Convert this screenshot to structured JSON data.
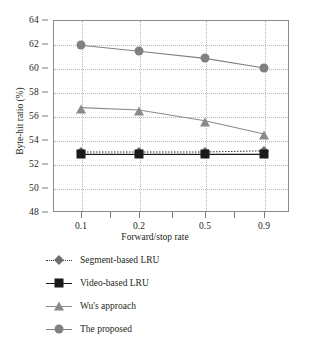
{
  "chart_data": {
    "type": "line",
    "title": "",
    "xlabel": "Forward/stop rate",
    "ylabel": "Byte-hit ratio (%)",
    "categories": [
      "0.1",
      "0.2",
      "0.5",
      "0.9"
    ],
    "x": [
      0.1,
      0.2,
      0.5,
      0.9
    ],
    "xtick_labels": [
      "0.1",
      "0.2",
      "0.5",
      "0.9"
    ],
    "ytick_labels": [
      "48",
      "50",
      "52",
      "54",
      "56",
      "58",
      "60",
      "62",
      "64"
    ],
    "yticks": [
      48,
      50,
      52,
      54,
      56,
      58,
      60,
      62,
      64
    ],
    "ylim": [
      48,
      64
    ],
    "grid": true,
    "legend_position": "below",
    "series": [
      {
        "name": "Segment-based LRU",
        "marker": "diamond",
        "color": "#6e6e6e",
        "linestyle": "dotted",
        "values": [
          53.0,
          53.0,
          53.0,
          53.1
        ]
      },
      {
        "name": "Video-based LRU",
        "marker": "square",
        "color": "#1a1a1a",
        "linestyle": "solid",
        "values": [
          52.8,
          52.8,
          52.8,
          52.8
        ]
      },
      {
        "name": "Wu's approach",
        "marker": "triangle",
        "color": "#8a8a8a",
        "linestyle": "solid",
        "values": [
          56.7,
          56.5,
          55.6,
          54.5
        ]
      },
      {
        "name": "The proposed",
        "marker": "circle",
        "color": "#808080",
        "linestyle": "solid",
        "values": [
          61.9,
          61.4,
          60.8,
          60.0
        ]
      }
    ]
  },
  "axes": {
    "y_title": "Byte-hit ratio (%)",
    "x_title": "Forward/stop rate",
    "y_labels": [
      "64",
      "62",
      "60",
      "58",
      "56",
      "54",
      "52",
      "50",
      "48"
    ],
    "x_labels": [
      "0.1",
      "0.2",
      "0.5",
      "0.9"
    ]
  },
  "legend": {
    "items": [
      {
        "label": "Segment-based LRU"
      },
      {
        "label": "Video-based LRU"
      },
      {
        "label": "Wu's approach"
      },
      {
        "label": "The proposed"
      }
    ]
  },
  "colors": {
    "frame": "#8c8c8c",
    "grid": "#b9b9b9",
    "text": "#231f20",
    "proposed": "#808080",
    "wu": "#8a8a8a",
    "video_lru": "#1a1a1a",
    "segment_lru": "#6e6e6e"
  }
}
